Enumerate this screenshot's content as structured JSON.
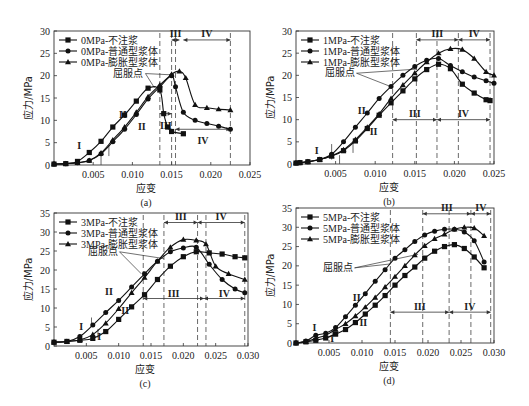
{
  "figure": {
    "yield_point_label": "屈服点",
    "xlabel": "应变",
    "ylabel": "应力/MPa"
  },
  "chart_data": [
    {
      "id": "a",
      "caption": "(a)",
      "type": "line",
      "title": "",
      "xlabel": "应变",
      "ylabel": "应力/MPa",
      "xlim": [
        0,
        0.025
      ],
      "ylim": [
        0,
        30
      ],
      "xticks": [
        "0.005",
        "0.010",
        "0.015",
        "0.020",
        "0.025"
      ],
      "yticks": [
        "0",
        "5",
        "10",
        "15",
        "20",
        "25",
        "30"
      ],
      "legend_position": "upper left",
      "series": [
        {
          "name": "0MPa-不注浆",
          "marker": "square",
          "x": [
            0,
            0.0015,
            0.003,
            0.0045,
            0.006,
            0.0075,
            0.009,
            0.0105,
            0.012,
            0.0135,
            0.014,
            0.0145,
            0.015,
            0.0165
          ],
          "y": [
            0.2,
            0.3,
            0.8,
            2.8,
            5.3,
            8.5,
            11.2,
            14.3,
            17.2,
            16.8,
            11.5,
            8.5,
            7.5,
            7.0
          ]
        },
        {
          "name": "0MPa-普通型浆体",
          "marker": "circle",
          "x": [
            0,
            0.0015,
            0.003,
            0.0045,
            0.006,
            0.0075,
            0.009,
            0.0105,
            0.012,
            0.0135,
            0.015,
            0.0155,
            0.0165,
            0.018,
            0.0195,
            0.021,
            0.0225
          ],
          "y": [
            0.2,
            0.3,
            0.5,
            1.0,
            2.5,
            5.2,
            8.0,
            11.3,
            14.8,
            17.5,
            20.0,
            17.5,
            11.8,
            10.0,
            9.3,
            8.7,
            8.0
          ]
        },
        {
          "name": "0MPa-膨胀型浆体",
          "marker": "triangle",
          "x": [
            0,
            0.0015,
            0.003,
            0.0045,
            0.006,
            0.0075,
            0.009,
            0.0105,
            0.012,
            0.0135,
            0.015,
            0.016,
            0.0168,
            0.018,
            0.0195,
            0.021,
            0.0225
          ],
          "y": [
            0.2,
            0.3,
            0.5,
            1.0,
            2.7,
            5.6,
            8.5,
            11.8,
            15.3,
            17.9,
            20.3,
            21.0,
            19.5,
            13.5,
            12.8,
            12.5,
            12.3
          ]
        }
      ],
      "annotations": [
        "I",
        "II",
        "II",
        "III",
        "III",
        "IV",
        "IV",
        "屈服点"
      ]
    },
    {
      "id": "b",
      "caption": "(b)",
      "type": "line",
      "title": "",
      "xlabel": "应变",
      "ylabel": "应力/MPa",
      "xlim": [
        0,
        0.025
      ],
      "ylim": [
        0,
        30
      ],
      "xticks": [
        "0.005",
        "0.010",
        "0.015",
        "0.020",
        "0.025"
      ],
      "yticks": [
        "0",
        "5",
        "10",
        "15",
        "20",
        "25",
        "30"
      ],
      "legend_position": "upper left",
      "series": [
        {
          "name": "1MPa-不注浆",
          "marker": "square",
          "x": [
            0,
            0.0005,
            0.0015,
            0.003,
            0.0045,
            0.006,
            0.0075,
            0.009,
            0.0105,
            0.012,
            0.0135,
            0.015,
            0.0165,
            0.018,
            0.0195,
            0.021,
            0.0225,
            0.024,
            0.0245
          ],
          "y": [
            0.2,
            0.3,
            0.5,
            1.0,
            1.8,
            3.0,
            5.2,
            8.0,
            11.0,
            13.8,
            16.5,
            19.2,
            21.3,
            22.5,
            21.5,
            18.0,
            16.0,
            14.5,
            14.3
          ]
        },
        {
          "name": "1MPa-普通型浆体",
          "marker": "circle",
          "x": [
            0,
            0.0005,
            0.0015,
            0.003,
            0.0045,
            0.006,
            0.0075,
            0.009,
            0.0105,
            0.012,
            0.0135,
            0.015,
            0.0165,
            0.018,
            0.0195,
            0.021,
            0.0225,
            0.024,
            0.025
          ],
          "y": [
            0.2,
            0.3,
            0.5,
            1.0,
            2.2,
            5.0,
            8.3,
            11.5,
            14.8,
            17.5,
            20.0,
            22.0,
            23.4,
            23.8,
            22.2,
            20.8,
            19.6,
            18.8,
            18.2
          ]
        },
        {
          "name": "1MPa-膨胀型浆体",
          "marker": "triangle",
          "x": [
            0,
            0.0005,
            0.0015,
            0.003,
            0.0045,
            0.006,
            0.0075,
            0.009,
            0.0105,
            0.012,
            0.0135,
            0.015,
            0.0165,
            0.018,
            0.0195,
            0.021,
            0.0225,
            0.024,
            0.025
          ],
          "y": [
            0.2,
            0.3,
            0.5,
            1.0,
            1.8,
            3.2,
            5.5,
            8.3,
            11.3,
            14.8,
            17.8,
            20.5,
            23.0,
            25.0,
            26.0,
            25.8,
            23.8,
            20.8,
            20.0
          ]
        }
      ],
      "annotations": [
        "I",
        "I",
        "II",
        "II",
        "III",
        "III",
        "IV",
        "IV",
        "屈服点"
      ]
    },
    {
      "id": "c",
      "caption": "(c)",
      "type": "line",
      "title": "",
      "xlabel": "应变",
      "ylabel": "应力/MPa",
      "xlim": [
        0,
        0.03
      ],
      "ylim": [
        0,
        35
      ],
      "xticks": [
        "0.005",
        "0.010",
        "0.015",
        "0.020",
        "0.025",
        "0.030"
      ],
      "yticks": [
        "0",
        "5",
        "10",
        "15",
        "20",
        "25",
        "30",
        "35"
      ],
      "legend_position": "upper left",
      "series": [
        {
          "name": "3MPa-不注浆",
          "marker": "square",
          "x": [
            0,
            0.002,
            0.004,
            0.006,
            0.008,
            0.01,
            0.012,
            0.014,
            0.016,
            0.018,
            0.02,
            0.022,
            0.024,
            0.026,
            0.028,
            0.0295
          ],
          "y": [
            1.0,
            1.2,
            1.5,
            2.0,
            3.8,
            7.0,
            10.3,
            13.5,
            17.5,
            21.0,
            23.5,
            24.8,
            24.5,
            24.2,
            23.5,
            23.2
          ]
        },
        {
          "name": "3MPa-普通型浆体",
          "marker": "circle",
          "x": [
            0,
            0.002,
            0.004,
            0.006,
            0.008,
            0.01,
            0.012,
            0.014,
            0.016,
            0.018,
            0.02,
            0.022,
            0.024,
            0.026,
            0.028,
            0.0295
          ],
          "y": [
            1.0,
            1.2,
            2.5,
            5.5,
            8.8,
            12.0,
            15.5,
            19.0,
            22.3,
            24.8,
            25.8,
            26.0,
            21.5,
            17.5,
            15.0,
            14.0
          ]
        },
        {
          "name": "3MPa-膨胀型浆体",
          "marker": "triangle",
          "x": [
            0,
            0.002,
            0.004,
            0.006,
            0.008,
            0.01,
            0.012,
            0.014,
            0.016,
            0.018,
            0.02,
            0.022,
            0.0235,
            0.025,
            0.027,
            0.0295
          ],
          "y": [
            1.0,
            1.2,
            1.6,
            3.0,
            6.0,
            9.8,
            14.0,
            18.0,
            22.3,
            26.0,
            28.0,
            27.8,
            26.8,
            21.0,
            19.0,
            17.5
          ]
        }
      ],
      "annotations": [
        "I",
        "I",
        "II",
        "II",
        "III",
        "III",
        "IV",
        "IV",
        "屈服点"
      ]
    },
    {
      "id": "d",
      "caption": "(d)",
      "type": "line",
      "title": "",
      "xlabel": "应变",
      "ylabel": "应力/MPa",
      "xlim": [
        0,
        0.03
      ],
      "ylim": [
        0,
        35
      ],
      "xticks": [
        "0.005",
        "0.010",
        "0.015",
        "0.020",
        "0.025",
        "0.030"
      ],
      "yticks": [
        "0",
        "5",
        "10",
        "15",
        "20",
        "25",
        "30",
        "35"
      ],
      "legend_position": "upper left",
      "series": [
        {
          "name": "5MPa-不注浆",
          "marker": "square",
          "x": [
            0,
            0.0015,
            0.003,
            0.0045,
            0.006,
            0.0075,
            0.009,
            0.0105,
            0.012,
            0.0135,
            0.015,
            0.0165,
            0.018,
            0.0195,
            0.021,
            0.0225,
            0.024,
            0.0255,
            0.027,
            0.0285
          ],
          "y": [
            0,
            0.3,
            0.7,
            1.3,
            2.3,
            3.5,
            5.3,
            7.5,
            9.8,
            12.3,
            15.0,
            17.5,
            19.7,
            22.0,
            23.8,
            25.0,
            25.5,
            24.5,
            22.3,
            19.5
          ]
        },
        {
          "name": "5MPa-普通型浆体",
          "marker": "circle",
          "x": [
            0,
            0.0015,
            0.003,
            0.0045,
            0.006,
            0.0075,
            0.009,
            0.0105,
            0.012,
            0.0135,
            0.015,
            0.0165,
            0.018,
            0.0195,
            0.021,
            0.0225,
            0.024,
            0.0255,
            0.027,
            0.0285
          ],
          "y": [
            0,
            0.5,
            2.0,
            2.5,
            4.0,
            6.8,
            9.8,
            12.8,
            16.0,
            19.0,
            22.0,
            24.2,
            26.3,
            28.0,
            29.0,
            29.5,
            29.5,
            28.8,
            26.5,
            21.0
          ]
        },
        {
          "name": "5MPa-膨胀型浆体",
          "marker": "triangle",
          "x": [
            0,
            0.0015,
            0.003,
            0.0045,
            0.006,
            0.0075,
            0.009,
            0.0105,
            0.012,
            0.0135,
            0.015,
            0.0165,
            0.018,
            0.0195,
            0.021,
            0.0225,
            0.024,
            0.0255,
            0.027,
            0.0285
          ],
          "y": [
            0,
            0.3,
            1.2,
            2.0,
            3.5,
            5.0,
            7.0,
            9.3,
            11.8,
            14.5,
            17.2,
            20.0,
            22.8,
            25.2,
            27.0,
            28.2,
            29.5,
            30.0,
            29.8,
            27.8
          ]
        }
      ],
      "annotations": [
        "I",
        "I",
        "II",
        "II",
        "III",
        "III",
        "IV",
        "IV",
        "屈服点"
      ]
    }
  ]
}
